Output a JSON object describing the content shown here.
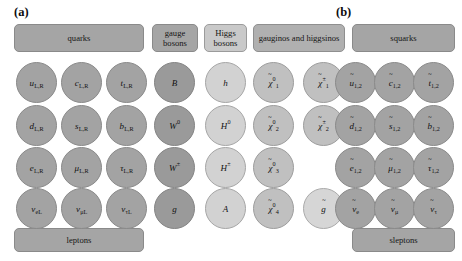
{
  "figure": {
    "panel_a_label": "(a)",
    "panel_b_label": "(b)",
    "background_color": "#ffffff"
  },
  "colors": {
    "fermion": "#a3a3a3",
    "gauge_boson": "#9a9a9a",
    "higgs_boson": "#d2d2d2",
    "gaugino": "#c0c0c0",
    "gluino": "#d6d6d6",
    "sfermion": "#a3a3a3",
    "band_dark": "#a5a5a5",
    "band_mid": "#b0b0b0",
    "band_light": "#c9c9c9",
    "outline": "#8a8a8a"
  },
  "panel_a": {
    "headers": {
      "quarks": "quarks",
      "gauge_bosons": "gauge bosons",
      "higgs_bosons": "Higgs bosons",
      "gauginos_higgsinos": "gauginos and higgsinos"
    },
    "footers": {
      "leptons": "leptons"
    },
    "quarks_up": [
      {
        "base": "u",
        "sub": "L,R"
      },
      {
        "base": "c",
        "sub": "L,R"
      },
      {
        "base": "t",
        "sub": "L,R"
      }
    ],
    "quarks_down": [
      {
        "base": "d",
        "sub": "L,R"
      },
      {
        "base": "s",
        "sub": "L,R"
      },
      {
        "base": "b",
        "sub": "L,R"
      }
    ],
    "leptons_charged": [
      {
        "base": "e",
        "sub": "L,R"
      },
      {
        "base": "μ",
        "sub": "L,R"
      },
      {
        "base": "τ",
        "sub": "L,R"
      }
    ],
    "leptons_neutrino": [
      {
        "base": "ν",
        "sub": "eL"
      },
      {
        "base": "ν",
        "sub": "μL"
      },
      {
        "base": "ν",
        "sub": "τL"
      }
    ],
    "gauge_bosons": [
      {
        "base": "B",
        "sup": ""
      },
      {
        "base": "W",
        "sup": "0"
      },
      {
        "base": "W",
        "sup": "±"
      },
      {
        "base": "g",
        "sup": ""
      }
    ],
    "higgs_bosons": [
      {
        "base": "h",
        "sup": ""
      },
      {
        "base": "H",
        "sup": "0"
      },
      {
        "base": "H",
        "sup": "±"
      },
      {
        "base": "A",
        "sup": ""
      }
    ],
    "neutralinos": [
      {
        "base": "χ",
        "tilde": true,
        "sub": "1",
        "sup": "0"
      },
      {
        "base": "χ",
        "tilde": true,
        "sub": "2",
        "sup": "0"
      },
      {
        "base": "χ",
        "tilde": true,
        "sub": "3",
        "sup": "0"
      },
      {
        "base": "χ",
        "tilde": true,
        "sub": "4",
        "sup": "0"
      }
    ],
    "charginos": [
      {
        "base": "χ",
        "tilde": true,
        "sub": "1",
        "sup": "±"
      },
      {
        "base": "χ",
        "tilde": true,
        "sub": "2",
        "sup": "±"
      },
      {
        "base": "",
        "empty": true
      },
      {
        "base": "g",
        "tilde": true,
        "gluino": true
      }
    ]
  },
  "panel_b": {
    "headers": {
      "squarks": "squarks"
    },
    "footers": {
      "sleptons": "sleptons"
    },
    "squarks_up": [
      {
        "base": "u",
        "tilde": true,
        "sub": "1,2"
      },
      {
        "base": "c",
        "tilde": true,
        "sub": "1,2"
      },
      {
        "base": "t",
        "tilde": true,
        "sub": "1,2"
      }
    ],
    "squarks_down": [
      {
        "base": "d",
        "tilde": true,
        "sub": "1,2"
      },
      {
        "base": "s",
        "tilde": true,
        "sub": "1,2"
      },
      {
        "base": "b",
        "tilde": true,
        "sub": "1,2"
      }
    ],
    "sleptons_charged": [
      {
        "base": "e",
        "tilde": true,
        "sub": "1,2"
      },
      {
        "base": "μ",
        "tilde": true,
        "sub": "1,2"
      },
      {
        "base": "τ",
        "tilde": true,
        "sub": "1,2"
      }
    ],
    "sleptons_sneutrino": [
      {
        "base": "ν",
        "tilde": true,
        "sub": "e"
      },
      {
        "base": "ν",
        "tilde": true,
        "sub": "μ"
      },
      {
        "base": "ν",
        "tilde": true,
        "sub": "τ"
      }
    ]
  }
}
